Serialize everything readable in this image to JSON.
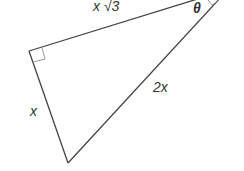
{
  "diagram": {
    "type": "right-triangle",
    "labels": {
      "top_side": "x √3",
      "left_side": "x",
      "hypotenuse": "2x",
      "angle": "θ"
    },
    "right_angle_marker": true,
    "colors": {
      "stroke": "#444444",
      "text": "#333333",
      "marker": "#999999",
      "background": "#ffffff"
    }
  }
}
